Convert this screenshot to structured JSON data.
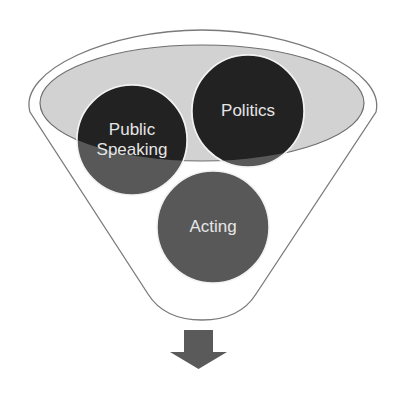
{
  "diagram": {
    "type": "funnel",
    "colors": {
      "background": "#ffffff",
      "funnel_outline": "#7a7a7a",
      "funnel_fill": "#ffffff",
      "rim_fill": "#d2d2d2",
      "rim_outline": "#6e6e6e",
      "circle_inside_rim": "#222222",
      "circle_outside_rim": "#585858",
      "circle_border": "#f2f2f2",
      "label_text": "#e6e6e6",
      "arrow_fill": "#5a5a5a"
    },
    "items": [
      {
        "id": "public-speaking",
        "label": "Public\nSpeaking",
        "cx": 132,
        "cy": 140,
        "r": 55
      },
      {
        "id": "politics",
        "label": "Politics",
        "cx": 248,
        "cy": 111,
        "r": 56
      },
      {
        "id": "acting",
        "label": "Acting",
        "cx": 213,
        "cy": 227,
        "r": 56
      }
    ],
    "output_arrow": {
      "direction": "down"
    }
  }
}
